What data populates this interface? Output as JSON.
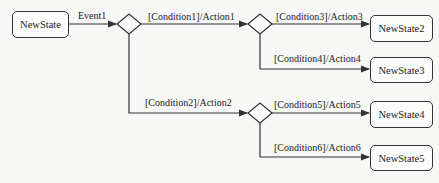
{
  "diagram": {
    "type": "state-machine-choice",
    "states": {
      "initial": "NewState",
      "s2": "NewState2",
      "s3": "NewState3",
      "s4": "NewState4",
      "s5": "NewState5"
    },
    "transitions": {
      "event": "Event1",
      "t1": "[Condition1]/Action1",
      "t2": "[Condition2]/Action2",
      "t3": "[Condition3]/Action3",
      "t4": "[Condition4]/Action4",
      "t5": "[Condition5]/Action5",
      "t6": "[Condition6]/Action6"
    },
    "colors": {
      "line": "#333333",
      "background": "#f7f7f6"
    }
  }
}
